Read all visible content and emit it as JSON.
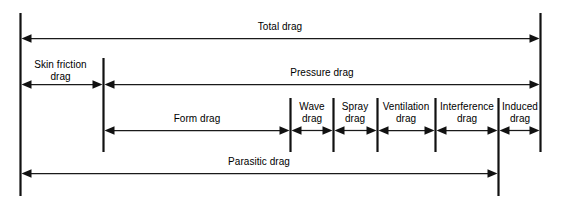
{
  "diagram": {
    "style": {
      "background": "#ffffff",
      "line_color": "#111111",
      "text_color": "#000000"
    },
    "rows": [
      {
        "row_name": "total-drag-row",
        "segments": [
          {
            "id": "total-drag",
            "label": "Total drag"
          }
        ]
      },
      {
        "row_name": "skin-pressure-row",
        "segments": [
          {
            "id": "skin-friction-drag",
            "label": "Skin friction drag",
            "line1": "Skin friction",
            "line2": "drag"
          },
          {
            "id": "pressure-drag",
            "label": "Pressure drag"
          }
        ]
      },
      {
        "row_name": "components-row",
        "segments": [
          {
            "id": "form-drag",
            "label": "Form drag",
            "line1": "Form drag",
            "line2": ""
          },
          {
            "id": "wave-drag",
            "label": "Wave drag",
            "line1": "Wave",
            "line2": "drag"
          },
          {
            "id": "spray-drag",
            "label": "Spray drag",
            "line1": "Spray",
            "line2": "drag"
          },
          {
            "id": "ventilation-drag",
            "label": "Ventilation drag",
            "line1": "Ventilation",
            "line2": "drag"
          },
          {
            "id": "interference-drag",
            "label": "Interference drag",
            "line1": "Interference",
            "line2": "drag"
          },
          {
            "id": "induced-drag",
            "label": "Induced drag",
            "line1": "Induced",
            "line2": "drag"
          }
        ]
      },
      {
        "row_name": "parasitic-drag-row",
        "segments": [
          {
            "id": "parasitic-drag",
            "label": "Parasitic drag"
          }
        ]
      }
    ],
    "labels": {
      "total_drag": "Total drag",
      "skin_friction_l1": "Skin friction",
      "skin_friction_l2": "drag",
      "pressure_drag": "Pressure drag",
      "form_drag": "Form drag",
      "wave_l1": "Wave",
      "wave_l2": "drag",
      "spray_l1": "Spray",
      "spray_l2": "drag",
      "ventilation_l1": "Ventilation",
      "ventilation_l2": "drag",
      "interference_l1": "Interference",
      "interference_l2": "drag",
      "induced_l1": "Induced",
      "induced_l2": "drag",
      "parasitic_drag": "Parasitic drag"
    }
  }
}
